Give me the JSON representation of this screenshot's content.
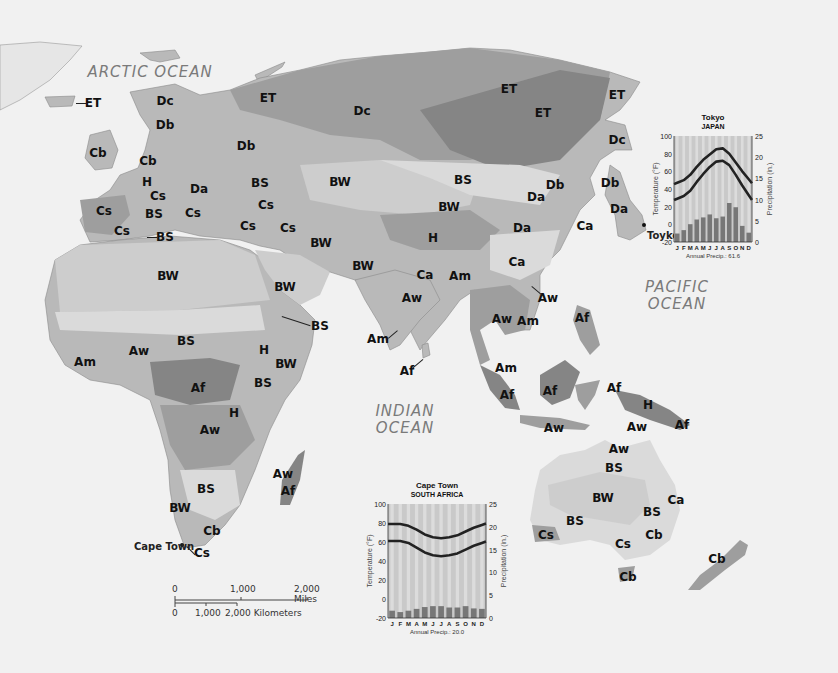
{
  "map": {
    "oceans": [
      {
        "id": "arctic",
        "label": "ARCTIC OCEAN",
        "x": 150,
        "y": 72
      },
      {
        "id": "pacific",
        "label": "PACIFIC\nOCEAN",
        "x": 677,
        "y": 296
      },
      {
        "id": "indian",
        "label": "INDIAN\nOCEAN",
        "x": 405,
        "y": 420
      }
    ],
    "climate_labels": [
      {
        "code": "ET",
        "x": 93,
        "y": 103
      },
      {
        "code": "Dc",
        "x": 165,
        "y": 101
      },
      {
        "code": "Db",
        "x": 165,
        "y": 125
      },
      {
        "code": "Cb",
        "x": 98,
        "y": 153
      },
      {
        "code": "Cb",
        "x": 148,
        "y": 161
      },
      {
        "code": "H",
        "x": 147,
        "y": 182
      },
      {
        "code": "Da",
        "x": 199,
        "y": 189
      },
      {
        "code": "Cs",
        "x": 104,
        "y": 211
      },
      {
        "code": "Cs",
        "x": 158,
        "y": 196
      },
      {
        "code": "BS",
        "x": 154,
        "y": 214
      },
      {
        "code": "Cs",
        "x": 193,
        "y": 213
      },
      {
        "code": "Cs",
        "x": 122,
        "y": 231
      },
      {
        "code": "BS",
        "x": 165,
        "y": 237
      },
      {
        "code": "Db",
        "x": 246,
        "y": 146
      },
      {
        "code": "BS",
        "x": 260,
        "y": 183
      },
      {
        "code": "Cs",
        "x": 266,
        "y": 205
      },
      {
        "code": "Cs",
        "x": 248,
        "y": 226
      },
      {
        "code": "Cs",
        "x": 288,
        "y": 228
      },
      {
        "code": "ET",
        "x": 268,
        "y": 98
      },
      {
        "code": "Dc",
        "x": 362,
        "y": 111
      },
      {
        "code": "ET",
        "x": 509,
        "y": 89
      },
      {
        "code": "ET",
        "x": 543,
        "y": 113
      },
      {
        "code": "ET",
        "x": 617,
        "y": 95
      },
      {
        "code": "Dc",
        "x": 617,
        "y": 140
      },
      {
        "code": "BW",
        "x": 340,
        "y": 182
      },
      {
        "code": "BS",
        "x": 463,
        "y": 180
      },
      {
        "code": "BW",
        "x": 449,
        "y": 207
      },
      {
        "code": "Db",
        "x": 555,
        "y": 185
      },
      {
        "code": "Db",
        "x": 610,
        "y": 183
      },
      {
        "code": "Da",
        "x": 536,
        "y": 197
      },
      {
        "code": "Da",
        "x": 619,
        "y": 209
      },
      {
        "code": "Da",
        "x": 522,
        "y": 228
      },
      {
        "code": "Ca",
        "x": 585,
        "y": 226
      },
      {
        "code": "H",
        "x": 433,
        "y": 238
      },
      {
        "code": "BW",
        "x": 321,
        "y": 243
      },
      {
        "code": "BW",
        "x": 363,
        "y": 266
      },
      {
        "code": "BW",
        "x": 168,
        "y": 276
      },
      {
        "code": "BW",
        "x": 285,
        "y": 287
      },
      {
        "code": "BS",
        "x": 320,
        "y": 326
      },
      {
        "code": "BS",
        "x": 186,
        "y": 341
      },
      {
        "code": "Aw",
        "x": 139,
        "y": 351
      },
      {
        "code": "Am",
        "x": 85,
        "y": 362
      },
      {
        "code": "H",
        "x": 264,
        "y": 350
      },
      {
        "code": "BW",
        "x": 286,
        "y": 364
      },
      {
        "code": "Af",
        "x": 198,
        "y": 388
      },
      {
        "code": "BS",
        "x": 263,
        "y": 383
      },
      {
        "code": "H",
        "x": 234,
        "y": 413
      },
      {
        "code": "Aw",
        "x": 210,
        "y": 430
      },
      {
        "code": "Ca",
        "x": 425,
        "y": 275
      },
      {
        "code": "Am",
        "x": 460,
        "y": 276
      },
      {
        "code": "Ca",
        "x": 517,
        "y": 262
      },
      {
        "code": "Aw",
        "x": 412,
        "y": 298
      },
      {
        "code": "Aw",
        "x": 548,
        "y": 298
      },
      {
        "code": "Aw",
        "x": 502,
        "y": 319
      },
      {
        "code": "Am",
        "x": 528,
        "y": 321
      },
      {
        "code": "Af",
        "x": 582,
        "y": 318
      },
      {
        "code": "Am",
        "x": 378,
        "y": 339
      },
      {
        "code": "Af",
        "x": 407,
        "y": 371
      },
      {
        "code": "Am",
        "x": 506,
        "y": 368
      },
      {
        "code": "Af",
        "x": 507,
        "y": 395
      },
      {
        "code": "Af",
        "x": 550,
        "y": 391
      },
      {
        "code": "Af",
        "x": 614,
        "y": 388
      },
      {
        "code": "H",
        "x": 648,
        "y": 405
      },
      {
        "code": "Af",
        "x": 682,
        "y": 425
      },
      {
        "code": "Aw",
        "x": 554,
        "y": 428
      },
      {
        "code": "Aw",
        "x": 637,
        "y": 427
      },
      {
        "code": "Aw",
        "x": 619,
        "y": 449
      },
      {
        "code": "BS",
        "x": 614,
        "y": 468
      },
      {
        "code": "BW",
        "x": 603,
        "y": 498
      },
      {
        "code": "Ca",
        "x": 676,
        "y": 500
      },
      {
        "code": "BS",
        "x": 652,
        "y": 512
      },
      {
        "code": "BS",
        "x": 575,
        "y": 521
      },
      {
        "code": "Cs",
        "x": 546,
        "y": 535
      },
      {
        "code": "Cs",
        "x": 623,
        "y": 544
      },
      {
        "code": "Cb",
        "x": 654,
        "y": 535
      },
      {
        "code": "Cb",
        "x": 628,
        "y": 577
      },
      {
        "code": "Cb",
        "x": 717,
        "y": 559
      },
      {
        "code": "Aw",
        "x": 283,
        "y": 474
      },
      {
        "code": "Af",
        "x": 288,
        "y": 491
      },
      {
        "code": "BS",
        "x": 206,
        "y": 489
      },
      {
        "code": "BW",
        "x": 180,
        "y": 508
      },
      {
        "code": "Cb",
        "x": 212,
        "y": 531
      },
      {
        "code": "Cs",
        "x": 202,
        "y": 553
      }
    ],
    "cities": [
      {
        "name": "Toyko",
        "x": 647,
        "y": 235,
        "dot_x": 644,
        "dot_y": 225
      },
      {
        "name": "Cape Town",
        "x": 134,
        "y": 546,
        "dot_x": 182,
        "dot_y": 545
      }
    ],
    "scale_bar": {
      "miles_ticks": [
        "0",
        "1,000",
        "2,000 Miles"
      ],
      "km_ticks": [
        "0",
        "1,000",
        "2,000 Kilometers"
      ]
    }
  },
  "chart_data": [
    {
      "type": "bar",
      "title": "Tokyo",
      "subtitle": "JAPAN",
      "categories": [
        "J",
        "F",
        "M",
        "A",
        "M",
        "J",
        "J",
        "A",
        "S",
        "O",
        "N",
        "D"
      ],
      "xlabel": "Annual Precip.: 61.6",
      "ylabel": "Temperature (°F)",
      "y2label": "Precipitation (in.)",
      "ylim": [
        -20,
        100
      ],
      "y_ticks": [
        100,
        80,
        60,
        40,
        20,
        0,
        -20
      ],
      "y2lim": [
        0,
        25
      ],
      "y2_ticks": [
        25,
        20,
        15,
        10,
        5,
        0
      ],
      "series": [
        {
          "name": "Precipitation (in.)",
          "kind": "bar",
          "axis": "right",
          "values": [
            2.0,
            2.8,
            4.2,
            5.3,
            5.8,
            6.5,
            5.6,
            6.0,
            9.2,
            8.2,
            3.8,
            2.2
          ]
        },
        {
          "name": "Avg High Temp (°F)",
          "kind": "line",
          "axis": "left",
          "values": [
            47,
            50,
            56,
            65,
            73,
            79,
            85,
            86,
            80,
            70,
            60,
            51
          ]
        },
        {
          "name": "Avg Low Temp (°F)",
          "kind": "line",
          "axis": "left",
          "values": [
            29,
            32,
            38,
            48,
            57,
            65,
            71,
            72,
            67,
            56,
            44,
            33
          ]
        }
      ],
      "legend": "none",
      "grid": false
    },
    {
      "type": "bar",
      "title": "Cape Town",
      "subtitle": "SOUTH AFRICA",
      "categories": [
        "J",
        "F",
        "M",
        "A",
        "M",
        "J",
        "J",
        "A",
        "S",
        "O",
        "N",
        "D"
      ],
      "xlabel": "Annual Precip.: 20.0",
      "ylabel": "Temperature (°F)",
      "y2label": "Precipitation (in.)",
      "ylim": [
        -20,
        100
      ],
      "y_ticks": [
        100,
        80,
        60,
        40,
        20,
        0,
        -20
      ],
      "y2lim": [
        0,
        25
      ],
      "y2_ticks": [
        25,
        20,
        15,
        10,
        5,
        0
      ],
      "series": [
        {
          "name": "Precipitation (in.)",
          "kind": "bar",
          "axis": "right",
          "values": [
            1.6,
            1.3,
            1.6,
            2.0,
            2.4,
            2.6,
            2.6,
            2.3,
            2.3,
            2.6,
            2.1,
            2.0
          ]
        },
        {
          "name": "Avg High Temp (°F)",
          "kind": "line",
          "axis": "left",
          "values": [
            79,
            79,
            77,
            73,
            68,
            65,
            64,
            65,
            67,
            71,
            75,
            78
          ]
        },
        {
          "name": "Avg Low Temp (°F)",
          "kind": "line",
          "axis": "left",
          "values": [
            61,
            61,
            59,
            54,
            49,
            46,
            45,
            46,
            48,
            52,
            56,
            59
          ]
        }
      ],
      "legend": "none",
      "grid": false
    }
  ],
  "colors": {
    "sea": "#f1f1f1",
    "land": "#b9b9b9",
    "chart_bg": "#c9c9c9",
    "chart_stripe": "#dcdcdc",
    "bar": "#777777",
    "temp_line": "#222222"
  }
}
